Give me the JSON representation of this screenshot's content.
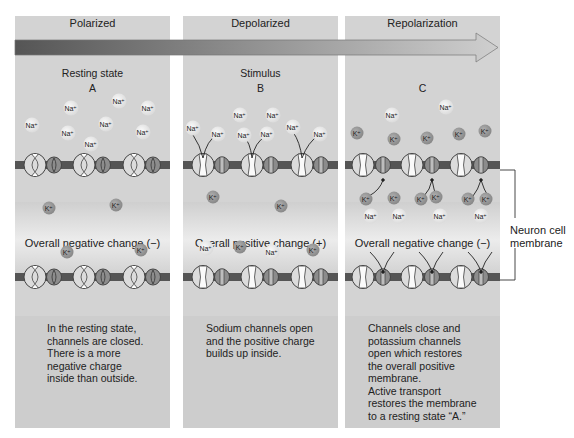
{
  "arrow": {
    "gradient_start": "#555555",
    "gradient_end": "#cfcfcf"
  },
  "panels": [
    {
      "title": "Polarized",
      "state_label": "Resting state",
      "letter": "A",
      "charge_label": "Overall negative change (−)",
      "description": [
        "In the resting state,",
        "channels are closed.",
        "There is a more",
        "negative charge",
        "inside than outside."
      ]
    },
    {
      "title": "Depolarized",
      "state_label": "Stimulus",
      "letter": "B",
      "charge_label": "Overall positive change (+)",
      "description": [
        "Sodium channels open",
        "and the positive charge",
        "builds up inside."
      ]
    },
    {
      "title": "Repolarization",
      "state_label": "",
      "letter": "C",
      "charge_label": "Overall negative change (−)",
      "description": [
        "Channels close and",
        "potassium channels",
        "open which restores",
        "the overall positive",
        "membrane.",
        "Active transport",
        "restores the membrane",
        "to a resting state “A.”"
      ]
    }
  ],
  "ions": {
    "sodium_label": "Na⁺",
    "potassium_label": "K⁺",
    "sodium_color": "#ececec",
    "potassium_color": "#9a9a9a"
  },
  "callout": {
    "label_line1": "Neuron cell",
    "label_line2": "membrane"
  },
  "colors": {
    "panel_bg": "#d3d3d3",
    "membrane": "#555555",
    "channel_large": "#dcdcdc",
    "channel_small": "#8c8c8c"
  }
}
